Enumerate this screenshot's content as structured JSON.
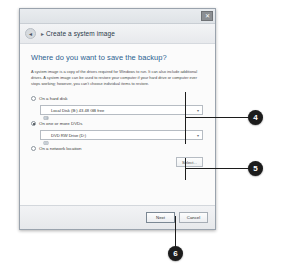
{
  "window": {
    "close_label": "✕",
    "breadcrumb_back": "◂",
    "breadcrumb_arrow": "▸",
    "breadcrumb_title": "Create a system image"
  },
  "main": {
    "page_title": "Where do you want to save the backup?",
    "description": "A system image is a copy of the drives required for Windows to run. It can also include additional drives. A system image can be used to restore your computer if your hard drive or computer ever stops working; however, you can't choose individual items to restore."
  },
  "options": [
    {
      "id": "hard-disk",
      "label": "On a hard disk",
      "selected": false,
      "combo_value": "Local Disk (B:) 43.48 GB free",
      "combo_arrow": "▾",
      "icon": "hard-disk-icon"
    },
    {
      "id": "dvd",
      "label": "On one or more DVDs",
      "selected": true,
      "combo_value": "DVD RW Drive (D:)",
      "combo_arrow": "▾",
      "icon": "dvd-drive-icon"
    },
    {
      "id": "network",
      "label": "On a network location",
      "selected": false,
      "button_label": "Select..."
    }
  ],
  "footer": {
    "next_label": "Next",
    "cancel_label": "Cancel"
  },
  "callouts": [
    {
      "id": "callout-4",
      "number": "4"
    },
    {
      "id": "callout-5",
      "number": "5"
    },
    {
      "id": "callout-6",
      "number": "6"
    }
  ]
}
